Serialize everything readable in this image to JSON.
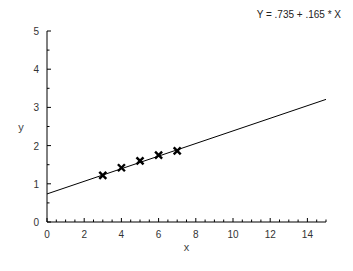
{
  "chart_data": {
    "type": "scatter",
    "title": "",
    "annotation": "Y = .735 + .165 * X",
    "xlabel": "x",
    "ylabel": "y",
    "xlim": [
      0,
      15
    ],
    "ylim": [
      0,
      5
    ],
    "x_ticks": [
      0,
      2,
      4,
      6,
      8,
      10,
      12,
      14
    ],
    "y_ticks": [
      0,
      1,
      2,
      3,
      4,
      5
    ],
    "grid": false,
    "series": [
      {
        "name": "observations",
        "marker": "x",
        "x": [
          3,
          4,
          5,
          6,
          7
        ],
        "y": [
          1.22,
          1.42,
          1.6,
          1.75,
          1.86
        ]
      },
      {
        "name": "fitted line",
        "type": "line",
        "intercept": 0.735,
        "slope": 0.165,
        "x": [
          0,
          15
        ],
        "y": [
          0.735,
          3.21
        ]
      }
    ]
  }
}
